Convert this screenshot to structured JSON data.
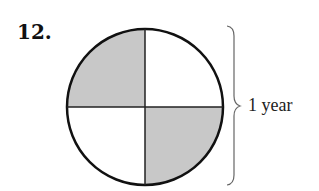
{
  "problem": {
    "number": "12.",
    "label": "1 year"
  },
  "figure": {
    "type": "circle divided into 4 quarters",
    "shaded_quarters": [
      "top-left",
      "bottom-right"
    ],
    "unshaded_quarters": [
      "top-right",
      "bottom-left"
    ],
    "shade_color": "#c8c8c8",
    "stroke_color": "#111111"
  }
}
